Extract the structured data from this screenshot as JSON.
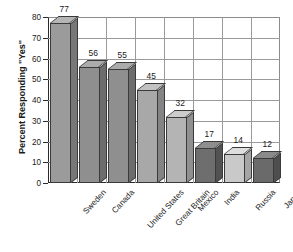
{
  "chart_data": {
    "type": "bar",
    "title": "",
    "subtitle": "",
    "xlabel": "",
    "ylabel": "Percent Responding \"Yes\"",
    "ylim": [
      0,
      80
    ],
    "ytick_step": 10,
    "yticks": [
      "0",
      "10",
      "20",
      "30",
      "40",
      "50",
      "60",
      "70",
      "80"
    ],
    "grid": "both",
    "legend": "none",
    "categories": [
      "Sweden",
      "Canada",
      "United States",
      "Great Britain",
      "Mexico",
      "India",
      "Russia",
      "Japan"
    ],
    "values": [
      77,
      56,
      55,
      45,
      32,
      17,
      14,
      12
    ],
    "value_labels": [
      "77",
      "56",
      "55",
      "45",
      "32",
      "17",
      "14",
      "12"
    ],
    "bar_colors": [
      "#9b9b9b",
      "#8f8f8f",
      "#8f8f8f",
      "#a8a8a8",
      "#b4b4b4",
      "#6e6e6e",
      "#c9c9c9",
      "#6a6a6a"
    ],
    "bar_top_colors": [
      "#b5b5b5",
      "#ababab",
      "#ababab",
      "#c2c2c2",
      "#cccccc",
      "#8e8e8e",
      "#dedede",
      "#8a8a8a"
    ],
    "bar_side_colors": [
      "#777777",
      "#6d6d6d",
      "#6d6d6d",
      "#848484",
      "#909090",
      "#525252",
      "#a5a5a5",
      "#4e4e4e"
    ],
    "axis_color": "#2b2b2b",
    "grid_color": "#9a9a9a",
    "background": "#ffffff",
    "text_color": "#1a1a1a"
  }
}
